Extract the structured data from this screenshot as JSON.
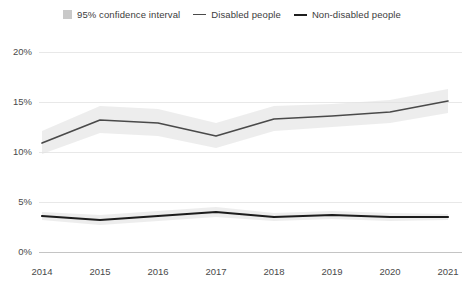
{
  "legend": {
    "items": [
      {
        "label": "95% confidence interval",
        "marker": "band-swatch-icon",
        "color": "#c9c9c9"
      },
      {
        "label": "Disabled people",
        "marker": "line-swatch-icon",
        "color": "#4a4a4a"
      },
      {
        "label": "Non-disabled people",
        "marker": "line-swatch-icon",
        "color": "#1c1c1c"
      }
    ]
  },
  "chart_data": {
    "type": "line",
    "title": "",
    "subtitle": "",
    "xlabel": "",
    "ylabel": "",
    "categories": [
      "2014",
      "2015",
      "2016",
      "2017",
      "2018",
      "2019",
      "2020",
      "2021"
    ],
    "x": [
      2014,
      2015,
      2016,
      2017,
      2018,
      2019,
      2020,
      2021
    ],
    "ylim": [
      0,
      20
    ],
    "yticks": [
      0,
      5,
      10,
      15,
      20
    ],
    "ytick_labels": [
      "0%",
      "5%",
      "10%",
      "15%",
      "20%"
    ],
    "xtick_labels": [
      "2014",
      "2015",
      "2016",
      "2017",
      "2018",
      "2019",
      "2020",
      "2021"
    ],
    "grid": true,
    "grid_axis": "y",
    "legend_position": "top-center",
    "series": [
      {
        "name": "Disabled people",
        "color": "#4a4a4a",
        "values": [
          10.9,
          13.2,
          12.9,
          11.6,
          13.3,
          13.6,
          14.0,
          15.1
        ],
        "ci_lower": [
          9.8,
          11.9,
          11.6,
          10.4,
          12.1,
          12.5,
          12.9,
          13.9
        ],
        "ci_upper": [
          12.1,
          14.6,
          14.3,
          12.9,
          14.6,
          14.8,
          15.2,
          16.3
        ]
      },
      {
        "name": "Non-disabled people",
        "color": "#1c1c1c",
        "values": [
          3.6,
          3.2,
          3.6,
          4.0,
          3.5,
          3.7,
          3.5,
          3.5
        ],
        "ci_lower": [
          3.2,
          2.7,
          3.1,
          3.5,
          3.1,
          3.3,
          3.1,
          3.2
        ],
        "ci_upper": [
          4.0,
          3.7,
          4.1,
          4.5,
          3.9,
          4.1,
          3.9,
          3.8
        ]
      }
    ]
  }
}
